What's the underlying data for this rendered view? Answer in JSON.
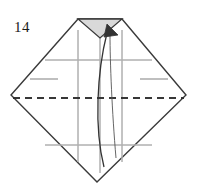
{
  "figure": {
    "kind": "origami-fold-diagram",
    "step_number": "14",
    "canvas": {
      "width": 198,
      "height": 189
    },
    "background_color": "#ffffff"
  },
  "colors": {
    "outline": "#3a3a3a",
    "crease_gray": "#b0b0b0",
    "fold_dashed": "#2b2b2b",
    "shading_fill": "#d9d9d9",
    "arrow": "#333333",
    "label_text": "#1a1a1a"
  },
  "shapes": {
    "outer_body": {
      "name": "folded-paper-outline",
      "points": "11,95 78,19 122,19 186,95 97,182",
      "fill": "#ffffff",
      "stroke": "#3a3a3a",
      "stroke_width": 1.4
    },
    "top_notch": {
      "name": "top-notch-triangle",
      "points": "78,19 122,19 100,38",
      "fill": "#d9d9d9",
      "stroke": "#3a3a3a",
      "stroke_width": 1.3
    }
  },
  "crease_lines": {
    "verticals": [
      {
        "name": "crease-vertical-left",
        "x": 78,
        "y1": 30,
        "y2": 162
      },
      {
        "name": "crease-vertical-center",
        "x": 100,
        "y1": 38,
        "y2": 173
      },
      {
        "name": "crease-vertical-right",
        "x": 122,
        "y1": 30,
        "y2": 162
      }
    ],
    "horizontals": [
      {
        "name": "crease-horizontal-upper",
        "x1": 45,
        "x2": 152,
        "y": 60
      },
      {
        "name": "crease-horizontal-lower",
        "x1": 45,
        "x2": 152,
        "y": 145
      }
    ],
    "side_marks": [
      {
        "name": "crease-side-mark-left",
        "x1": 30,
        "x2": 58,
        "y": 79
      },
      {
        "name": "crease-side-mark-right",
        "x1": 140,
        "x2": 168,
        "y": 79
      }
    ]
  },
  "fold_line": {
    "name": "valley-fold-dashed-line",
    "style": "dashed",
    "x1": 13,
    "x2": 184,
    "y": 98,
    "dash_pattern": "7 5",
    "stroke_width": 1.5
  },
  "arrow": {
    "name": "fold-direction-arrow",
    "description": "curved arrow sweeping from bottom point up to the top notch",
    "main_curve": "M 104,167 C 94,128 97,72 107,33",
    "secondary_curve": "M 116,158 C 112,112 110,62 110,34",
    "head": {
      "points": "107,24 118,35 104,37",
      "fill": "#333333"
    },
    "stroke_width": 1.3
  },
  "labels": {
    "step": {
      "name": "step-number-label",
      "text": "14",
      "x": 22,
      "y": 32
    }
  }
}
